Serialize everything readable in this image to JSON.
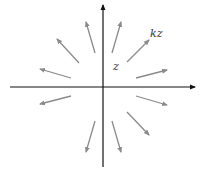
{
  "diagram": {
    "type": "vector-field",
    "labels": {
      "z": "z",
      "kz": "kz"
    },
    "colors": {
      "axis": "#111111",
      "vector": "#8a8a8a",
      "label": "#333333"
    },
    "axes": {
      "horizontal": {
        "x1": 10,
        "y1": 87,
        "x2": 195,
        "y2": 87
      },
      "vertical": {
        "x1": 103,
        "y1": 167,
        "x2": 103,
        "y2": 5
      }
    },
    "vectors": [
      {
        "name": "vector-up-left",
        "x1": 95,
        "y1": 53,
        "x2": 86,
        "y2": 22
      },
      {
        "name": "vector-up-right",
        "x1": 112,
        "y1": 53,
        "x2": 121,
        "y2": 22
      },
      {
        "name": "vector-kz",
        "x1": 127,
        "y1": 62,
        "x2": 149,
        "y2": 40
      },
      {
        "name": "vector-upper-left-diag",
        "x1": 79,
        "y1": 63,
        "x2": 57,
        "y2": 39
      },
      {
        "name": "vector-left-upper",
        "x1": 71,
        "y1": 78,
        "x2": 40,
        "y2": 69
      },
      {
        "name": "vector-right-upper",
        "x1": 136,
        "y1": 78,
        "x2": 167,
        "y2": 70
      },
      {
        "name": "vector-left-lower",
        "x1": 71,
        "y1": 96,
        "x2": 40,
        "y2": 104
      },
      {
        "name": "vector-right-lower",
        "x1": 136,
        "y1": 96,
        "x2": 167,
        "y2": 105
      },
      {
        "name": "vector-lower-right-diag",
        "x1": 127,
        "y1": 112,
        "x2": 149,
        "y2": 135
      },
      {
        "name": "vector-down-left",
        "x1": 95,
        "y1": 121,
        "x2": 86,
        "y2": 152
      },
      {
        "name": "vector-down-right",
        "x1": 112,
        "y1": 121,
        "x2": 121,
        "y2": 152
      }
    ]
  }
}
